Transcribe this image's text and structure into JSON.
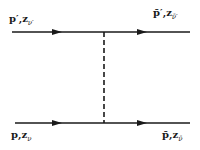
{
  "diagram": {
    "type": "feynman-exchange-diagram",
    "colors": {
      "line": "#1a1a1a",
      "background": "#ffffff"
    },
    "lines": {
      "top": {
        "direction": "left-to-right",
        "incoming_label": {
          "momentum": "p′",
          "separator": ",",
          "z": "z",
          "sub": "ν′"
        },
        "outgoing_label": {
          "momentum": "p̄′",
          "separator": ",",
          "z": "z",
          "sub": "ν̄′"
        }
      },
      "bottom": {
        "direction": "left-to-right",
        "incoming_label": {
          "momentum": "p",
          "separator": ",",
          "z": "z",
          "sub": "ν"
        },
        "outgoing_label": {
          "momentum": "p̄",
          "separator": ",",
          "z": "z",
          "sub": "ν̄"
        }
      },
      "exchange": {
        "style": "dashed",
        "orientation": "vertical"
      }
    }
  }
}
